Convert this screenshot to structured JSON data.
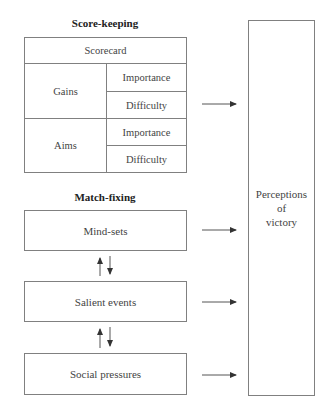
{
  "scorekeeping": {
    "heading": "Score-keeping",
    "scorecard": "Scorecard",
    "groups": [
      {
        "label": "Gains",
        "rows": [
          "Importance",
          "Difficulty"
        ]
      },
      {
        "label": "Aims",
        "rows": [
          "Importance",
          "Difficulty"
        ]
      }
    ]
  },
  "matchfixing": {
    "heading": "Match-fixing",
    "boxes": [
      "Mind-sets",
      "Salient events",
      "Social pressures"
    ]
  },
  "outcome": {
    "lines": [
      "Perceptions",
      "of",
      "victory"
    ]
  },
  "colors": {
    "line": "#808080",
    "arrow": "#333333",
    "text": "#444444"
  }
}
